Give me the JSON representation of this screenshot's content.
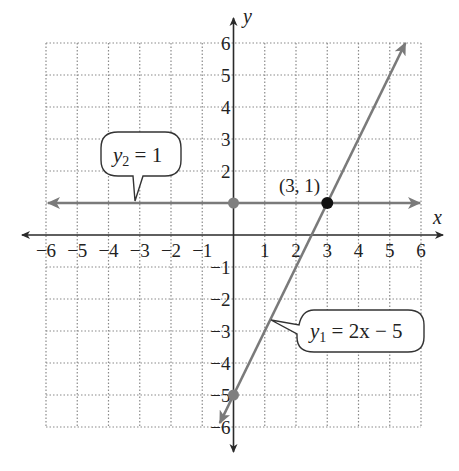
{
  "chart_data": {
    "type": "line",
    "title": "",
    "xlabel": "x",
    "ylabel": "y",
    "xlim": [
      -6,
      6
    ],
    "ylim": [
      -6,
      6
    ],
    "grid": true,
    "grid_style": "dotted",
    "x_ticks": [
      -6,
      -5,
      -4,
      -3,
      -2,
      -1,
      1,
      2,
      3,
      4,
      5,
      6
    ],
    "y_ticks": [
      6,
      5,
      4,
      3,
      2,
      -1,
      -2,
      -3,
      -4,
      -5,
      -6
    ],
    "x_tick_labels": [
      "−6",
      "−5",
      "−4",
      "−3",
      "−2",
      "−1",
      "1",
      "2",
      "3",
      "4",
      "5",
      "6"
    ],
    "y_tick_labels": [
      "6",
      "5",
      "4",
      "3",
      "2",
      "−1",
      "−2",
      "−3",
      "−4",
      "−5",
      "−6"
    ],
    "series": [
      {
        "name": "y1 = 2x − 5",
        "label_var": "y",
        "label_sub": "1",
        "label_rest": " = 2x − 5",
        "equation": "y1 = 2x - 5",
        "x": [
          -0.5,
          5.5
        ],
        "y": [
          -6,
          6
        ],
        "color": "#7a7a7a",
        "marked_points": [
          {
            "x": 0,
            "y": -5
          }
        ]
      },
      {
        "name": "y2 = 1",
        "label_var": "y",
        "label_sub": "2",
        "label_rest": " = 1",
        "equation": "y2 = 1",
        "x": [
          -6,
          6
        ],
        "y": [
          1,
          1
        ],
        "color": "#7a7a7a",
        "marked_points": [
          {
            "x": 0,
            "y": 1
          }
        ]
      }
    ],
    "annotations": [
      {
        "text": "(3, 1)",
        "x": 3,
        "y": 1,
        "type": "intersection-point"
      }
    ],
    "colors": {
      "axis": "#2a2a2a",
      "line": "#7a7a7a",
      "grid": "#8a8a8a",
      "marker": "#7f7f7f",
      "intersection": "#111111"
    }
  }
}
